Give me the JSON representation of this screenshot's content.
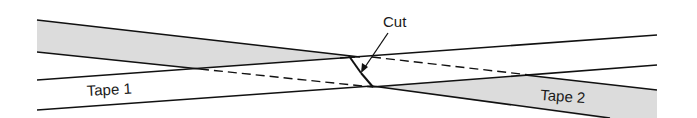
{
  "diagram": {
    "labels": {
      "cut": "Cut",
      "tape1": "Tape 1",
      "tape2": "Tape 2"
    },
    "colors": {
      "shade": "#dcdcdc",
      "line": "#111111",
      "background": "#ffffff"
    }
  }
}
